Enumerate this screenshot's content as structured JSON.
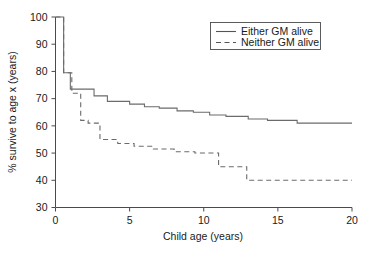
{
  "chart_data": {
    "type": "line",
    "title": "",
    "subtitle": "",
    "xlabel": "Child age (years)",
    "ylabel": "% survive to age x (years)",
    "xlim": [
      0,
      20
    ],
    "ylim": [
      30,
      100
    ],
    "xticks": [
      0,
      5,
      10,
      15,
      20
    ],
    "yticks": [
      30,
      40,
      50,
      60,
      70,
      80,
      90,
      100
    ],
    "xtick_labels": [
      "0",
      "5",
      "10",
      "15",
      "20"
    ],
    "ytick_labels": [
      "30",
      "40",
      "50",
      "60",
      "70",
      "80",
      "90",
      "100"
    ],
    "grid": false,
    "legend_position": "top-right",
    "step_style": "post",
    "series": [
      {
        "name": "Either GM alive",
        "style": "solid",
        "color": "#6b6b6b",
        "x": [
          0,
          0.55,
          0.55,
          1.0,
          1.0,
          1.6,
          1.6,
          2.6,
          2.6,
          3.5,
          3.5,
          4.3,
          4.3,
          5.0,
          5.0,
          6.0,
          6.0,
          7.0,
          7.0,
          8.2,
          8.2,
          9.3,
          9.3,
          10.4,
          10.4,
          11.5,
          11.5,
          13.0,
          13.0,
          14.3,
          14.3,
          16.3,
          16.3,
          20.0
        ],
        "y": [
          100,
          100,
          79.5,
          79.5,
          73.5,
          73.5,
          73.5,
          73.5,
          71.0,
          71.0,
          69.0,
          69.0,
          69.0,
          69.0,
          68.0,
          68.0,
          67.0,
          67.0,
          66.5,
          66.5,
          65.5,
          65.5,
          65.0,
          65.0,
          64.0,
          64.0,
          63.5,
          63.5,
          62.5,
          62.5,
          62.0,
          62.0,
          61.0,
          61.0
        ],
        "start_value": 100,
        "end_value": 61
      },
      {
        "name": "Neither GM alive",
        "style": "dashed",
        "color": "#6b6b6b",
        "x": [
          0,
          0.55,
          0.55,
          1.1,
          1.1,
          1.7,
          1.7,
          2.2,
          2.2,
          3.0,
          3.0,
          4.2,
          4.2,
          5.3,
          5.3,
          6.6,
          6.6,
          8.0,
          8.0,
          9.4,
          9.4,
          11.0,
          11.0,
          12.9,
          12.9,
          20.0
        ],
        "y": [
          100,
          100,
          79.5,
          79.5,
          72.0,
          72.0,
          62.0,
          62.0,
          61.0,
          61.0,
          55.0,
          55.0,
          53.5,
          53.5,
          52.5,
          52.5,
          51.5,
          51.5,
          50.5,
          50.5,
          50.0,
          50.0,
          45.0,
          45.0,
          40.0,
          40.0
        ],
        "start_value": 100,
        "end_value": 40
      }
    ],
    "legend_entries": [
      {
        "label": "Either GM alive",
        "style": "solid"
      },
      {
        "label": "Neither GM alive",
        "style": "dashed"
      }
    ]
  },
  "axes": {
    "x_title": "Child age (years)",
    "y_title": "% survive to age x (years)"
  },
  "legend": {
    "item_either": "Either GM alive",
    "item_neither": "Neither GM alive"
  }
}
